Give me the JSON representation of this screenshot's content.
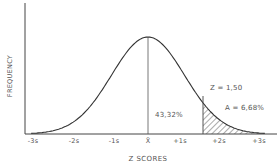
{
  "chart_data": {
    "type": "area",
    "title": "",
    "xlabel": "Z SCORES",
    "ylabel": "FREQUENCY",
    "x_ticks": [
      "-3s",
      "-2s",
      "-1s",
      "X̄",
      "+1s",
      "+2s",
      "+3s"
    ],
    "x_tick_values": [
      -3,
      -2,
      -1,
      0,
      1,
      2,
      3
    ],
    "curve": "standard normal distribution",
    "mean_line": 0,
    "shaded_region": {
      "from_z": 1.5,
      "to_z": 3,
      "pattern": "diagonal-hatch"
    },
    "annotations": [
      {
        "text": "Z = 1,50",
        "z": 1.5
      },
      {
        "text": "A = 6,68%",
        "meaning": "area beyond z=1.5"
      },
      {
        "text": "43,32%",
        "meaning": "area between mean and z=1.5"
      }
    ],
    "grid": false,
    "legend": null
  },
  "labels": {
    "ylabel": "FREQUENCY",
    "xlabel": "Z SCORES",
    "ticks": [
      "-3s",
      "-2s",
      "-1s",
      "X̄",
      "+1s",
      "+2s",
      "+3s"
    ],
    "z_annot": "Z = 1,50",
    "area_annot": "A = 6,68%",
    "middle_annot": "43,32%"
  },
  "colors": {
    "line": "#333333",
    "axis": "#444444",
    "text": "#555555"
  }
}
